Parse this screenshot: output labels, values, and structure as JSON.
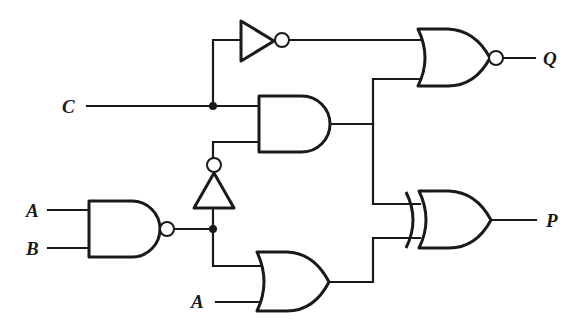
{
  "diagram": {
    "type": "logic-circuit",
    "inputs": [
      {
        "id": "input-c",
        "label": "C"
      },
      {
        "id": "input-a-top",
        "label": "A"
      },
      {
        "id": "input-b",
        "label": "B"
      },
      {
        "id": "input-a-bottom",
        "label": "A"
      }
    ],
    "outputs": [
      {
        "id": "output-q",
        "label": "Q"
      },
      {
        "id": "output-p",
        "label": "P"
      }
    ],
    "gates": [
      {
        "id": "nand1",
        "type": "NAND",
        "inputs": [
          "A",
          "B"
        ]
      },
      {
        "id": "not-upper",
        "type": "NOT",
        "inputs": [
          "C"
        ]
      },
      {
        "id": "not-middle",
        "type": "NOT",
        "inputs": [
          "nand1"
        ]
      },
      {
        "id": "and1",
        "type": "AND",
        "inputs": [
          "C",
          "not-middle"
        ]
      },
      {
        "id": "or1",
        "type": "OR",
        "inputs": [
          "nand1",
          "A"
        ]
      },
      {
        "id": "nor1",
        "type": "NOR",
        "inputs": [
          "not-upper",
          "and1"
        ],
        "output": "Q"
      },
      {
        "id": "xor1",
        "type": "XOR",
        "inputs": [
          "and1",
          "or1"
        ],
        "output": "P"
      }
    ],
    "colors": {
      "ink": "#1a1a1a",
      "background": "#ffffff"
    }
  }
}
